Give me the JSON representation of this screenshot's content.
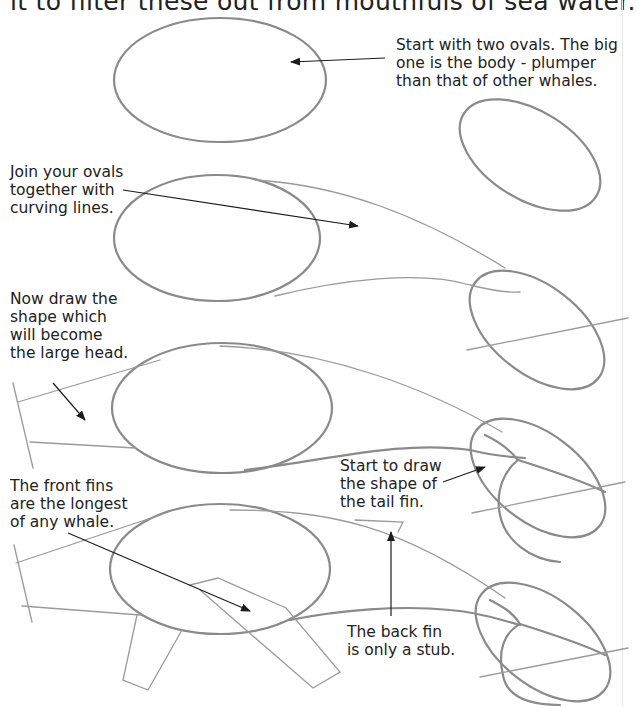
{
  "header": {
    "text": "it to filter these out from mouthfuls of sea water."
  },
  "steps": [
    {
      "id": "step-1",
      "caption": "Start with two ovals. The big\none is the body - plumper\nthan that of other whales."
    },
    {
      "id": "step-2",
      "caption": "Join your ovals\ntogether with\ncurving lines."
    },
    {
      "id": "step-3",
      "caption": "Now draw the\nshape which\nwill become\nthe large head."
    },
    {
      "id": "step-4",
      "caption": "Start to draw\nthe shape of\nthe tail fin."
    },
    {
      "id": "step-5a",
      "caption": "The front fins\nare the longest\nof any whale."
    },
    {
      "id": "step-5b",
      "caption": "The back fin\nis only a stub."
    }
  ],
  "colors": {
    "pencil": "#8a8a8a",
    "ink": "#1c1c1c",
    "background": "#ffffff"
  }
}
